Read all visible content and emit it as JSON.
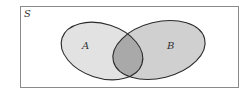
{
  "diagram": {
    "type": "venn",
    "universe": {
      "label": "S"
    },
    "sets": [
      {
        "id": "A",
        "label": "A",
        "fill": "#e2e2e2"
      },
      {
        "id": "B",
        "label": "B",
        "fill": "#d0d0d0"
      }
    ],
    "intersection": {
      "sets": [
        "A",
        "B"
      ],
      "fill": "#a9a9a9",
      "highlighted": true
    },
    "colors": {
      "border": "#8a8a8a",
      "outline": "#2a2a2a",
      "background": "#ffffff",
      "text": "#333333"
    }
  }
}
